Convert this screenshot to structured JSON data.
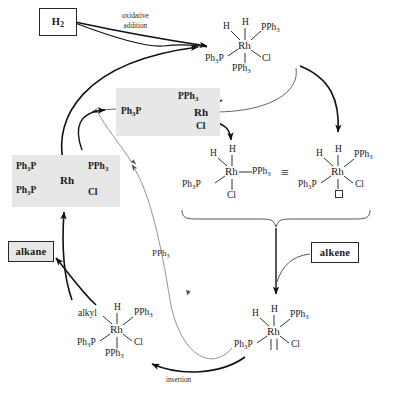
{
  "diagram": {
    "colors": {
      "shade": "#e7e7e7",
      "ink": "#1a1a1a",
      "bold_arrow": "#111111",
      "thin_arrow": "#555555"
    }
  },
  "boxes": {
    "h2": {
      "label": "H2",
      "label_main": "H",
      "label_sub": "2",
      "style": "white"
    },
    "alkane": {
      "label": "alkane",
      "style": "grey"
    },
    "alkene": {
      "label": "alkene",
      "style": "white"
    }
  },
  "annotations": {
    "oxidative_line1": "oxidative",
    "oxidative_line2": "addition",
    "pph3_released": "PPh",
    "pph3_released_sub": "3",
    "insertion": "insertion",
    "equivalent_symbol": "≡"
  },
  "structures": {
    "catalyst": {
      "name": "wilkinson-catalyst",
      "center": "Rh",
      "shaded": true,
      "ligands": [
        {
          "text": "Ph",
          "sub": "3",
          "tail": "P",
          "position": "upper-left"
        },
        {
          "text": "Ph",
          "sub": "3",
          "tail": "P",
          "position": "lower-left"
        },
        {
          "text": "PPh",
          "sub": "3",
          "tail": "",
          "position": "upper-right"
        },
        {
          "text": "Cl",
          "sub": "",
          "tail": "",
          "position": "lower-right"
        }
      ]
    },
    "three_coordinate": {
      "name": "three-coordinate-intermediate",
      "center": "Rh",
      "shaded": true,
      "ligands": [
        {
          "text": "Ph",
          "sub": "3",
          "tail": "P",
          "position": "left"
        },
        {
          "text": "PPh",
          "sub": "3",
          "tail": "",
          "position": "upper-right"
        },
        {
          "text": "Cl",
          "sub": "",
          "tail": "",
          "position": "lower-right"
        }
      ]
    },
    "dihydride_six": {
      "name": "dihydride-six-coordinate",
      "center": "Rh",
      "shaded": false,
      "ligands": [
        {
          "text": "H",
          "sub": "",
          "tail": "",
          "position": "top"
        },
        {
          "text": "H",
          "sub": "",
          "tail": "",
          "position": "upper-left"
        },
        {
          "text": "PPh",
          "sub": "3",
          "tail": "",
          "position": "upper-right"
        },
        {
          "text": "Ph",
          "sub": "3",
          "tail": "P",
          "position": "left"
        },
        {
          "text": "Cl",
          "sub": "",
          "tail": "",
          "position": "lower-right"
        },
        {
          "text": "PPh",
          "sub": "3",
          "tail": "",
          "position": "bottom"
        }
      ]
    },
    "dihydride_five": {
      "name": "dihydride-five-coordinate",
      "center": "Rh",
      "shaded": false,
      "ligands": [
        {
          "text": "H",
          "sub": "",
          "tail": "",
          "position": "top"
        },
        {
          "text": "H",
          "sub": "",
          "tail": "",
          "position": "upper-left"
        },
        {
          "text": "PPh",
          "sub": "3",
          "tail": "",
          "position": "right"
        },
        {
          "text": "Ph",
          "sub": "3",
          "tail": "P",
          "position": "left"
        },
        {
          "text": "Cl",
          "sub": "",
          "tail": "",
          "position": "bottom"
        }
      ]
    },
    "dihydride_vacant": {
      "name": "dihydride-with-vacant-site",
      "center": "Rh",
      "shaded": false,
      "ligands": [
        {
          "text": "H",
          "sub": "",
          "tail": "",
          "position": "top"
        },
        {
          "text": "H",
          "sub": "",
          "tail": "",
          "position": "upper-left"
        },
        {
          "text": "PPh",
          "sub": "3",
          "tail": "",
          "position": "upper-right"
        },
        {
          "text": "Ph",
          "sub": "3",
          "tail": "P",
          "position": "left"
        },
        {
          "text": "Cl",
          "sub": "",
          "tail": "",
          "position": "lower-right"
        },
        {
          "text": "",
          "sub": "",
          "tail": "",
          "position": "bottom-vacant"
        }
      ]
    },
    "alkene_complex": {
      "name": "alkene-complex",
      "center": "Rh",
      "shaded": false,
      "ligands": [
        {
          "text": "H",
          "sub": "",
          "tail": "",
          "position": "top"
        },
        {
          "text": "H",
          "sub": "",
          "tail": "",
          "position": "upper-left"
        },
        {
          "text": "PPh",
          "sub": "3",
          "tail": "",
          "position": "upper-right"
        },
        {
          "text": "Ph",
          "sub": "3",
          "tail": "P",
          "position": "left"
        },
        {
          "text": "Cl",
          "sub": "",
          "tail": "",
          "position": "lower-right"
        },
        {
          "text": "alkene-pi-bond",
          "sub": "",
          "tail": "",
          "position": "bottom"
        }
      ]
    },
    "alkyl_complex": {
      "name": "alkyl-hydride-complex",
      "center": "Rh",
      "shaded": false,
      "ligands": [
        {
          "text": "alkyl",
          "sub": "",
          "tail": "",
          "position": "upper-left"
        },
        {
          "text": "H",
          "sub": "",
          "tail": "",
          "position": "top"
        },
        {
          "text": "PPh",
          "sub": "3",
          "tail": "",
          "position": "upper-right"
        },
        {
          "text": "Ph",
          "sub": "3",
          "tail": "P",
          "position": "left"
        },
        {
          "text": "Cl",
          "sub": "",
          "tail": "",
          "position": "lower-right"
        },
        {
          "text": "PPh",
          "sub": "3",
          "tail": "",
          "position": "bottom"
        }
      ]
    }
  }
}
